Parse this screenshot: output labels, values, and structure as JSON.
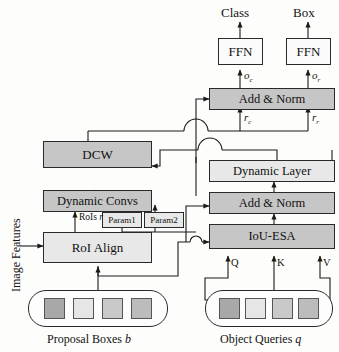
{
  "figure": {
    "type": "block-diagram"
  },
  "outputs": {
    "class_label": "Class",
    "box_label": "Box"
  },
  "nodes": {
    "ffn_class": {
      "label": "FFN",
      "fill": "#fbfbfb"
    },
    "ffn_box": {
      "label": "FFN",
      "fill": "#fbfbfb"
    },
    "add_norm_top": {
      "label": "Add & Norm",
      "fill": "#c6c6c6"
    },
    "dcw": {
      "label": "DCW",
      "fill": "#c6c6c6"
    },
    "dynamic_convs": {
      "label": "Dynamic Convs",
      "fill": "#c6c6c6"
    },
    "roi_align": {
      "label": "RoI Align",
      "fill": "#e8e8e8"
    },
    "dynamic_layer": {
      "label": "Dynamic Layer",
      "fill": "#e8e8e8"
    },
    "add_norm_bottom": {
      "label": "Add & Norm",
      "fill": "#c6c6c6"
    },
    "iou_esa": {
      "label": "IoU-ESA",
      "fill": "#c6c6c6"
    },
    "param1": {
      "label": "Param1",
      "fill": "#e8e8e8"
    },
    "param2": {
      "label": "Param2",
      "fill": "#e8e8e8"
    }
  },
  "edge_labels": {
    "o_c": "o",
    "o_c_sub": "c",
    "o_r": "o",
    "o_r_sub": "r",
    "r_c": "r",
    "r_c_sub": "c",
    "r_r": "r",
    "r_r_sub": "r",
    "rois": "RoIs",
    "rois_var": "r",
    "q": "Q",
    "k": "K",
    "v": "V"
  },
  "side_label": {
    "image_features": "Image Features"
  },
  "groups": {
    "proposal_boxes": {
      "caption": "Proposal Boxes",
      "caption_var": "b",
      "chips": [
        "#a8a8a8",
        "#e6e6e6",
        "#c9c9c9",
        "#bcbcbc"
      ]
    },
    "object_queries": {
      "caption": "Object Queries",
      "caption_var": "q",
      "chips": [
        "#a8a8a8",
        "#e6e6e6",
        "#c9c9c9",
        "#bcbcbc"
      ]
    }
  }
}
